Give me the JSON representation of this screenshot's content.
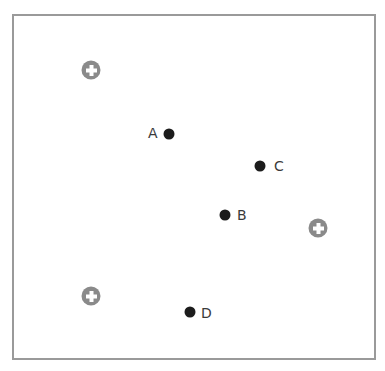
{
  "diagram": {
    "frame": {
      "border_color": "#9a9a9a"
    },
    "points": [
      {
        "label": "A",
        "x": 169,
        "y": 134,
        "label_side": "left"
      },
      {
        "label": "B",
        "x": 225,
        "y": 215,
        "label_side": "right"
      },
      {
        "label": "C",
        "x": 260,
        "y": 166,
        "label_side": "right"
      },
      {
        "label": "D",
        "x": 190,
        "y": 312,
        "label_side": "right"
      }
    ],
    "plus_markers": [
      {
        "icon": "plus-circle-icon",
        "x": 91,
        "y": 70
      },
      {
        "icon": "plus-circle-icon",
        "x": 318,
        "y": 228
      },
      {
        "icon": "plus-circle-icon",
        "x": 91,
        "y": 296
      }
    ],
    "colors": {
      "point": "#1c1c1c",
      "label": "#3a3a3a",
      "plus_marker": "#8a8a8a"
    }
  }
}
